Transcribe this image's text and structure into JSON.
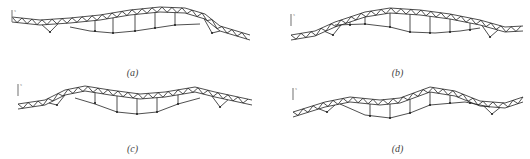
{
  "colors": {
    "line": "#222222",
    "axis": "#888888",
    "label": "#444444"
  },
  "panels": [
    {
      "id": "a",
      "caption": "(a)",
      "x": 0,
      "y": 0,
      "cap_y": 67,
      "axis": {
        "x": 12,
        "y": 18
      },
      "top": [
        [
          12,
          17
        ],
        [
          40,
          20
        ],
        [
          70,
          18
        ],
        [
          100,
          15
        ],
        [
          130,
          10
        ],
        [
          160,
          7
        ],
        [
          185,
          8
        ],
        [
          205,
          14
        ],
        [
          220,
          26
        ],
        [
          250,
          35
        ]
      ],
      "bottom": [
        [
          70,
          27
        ],
        [
          90,
          31
        ],
        [
          113,
          33
        ],
        [
          135,
          31
        ],
        [
          155,
          28
        ],
        [
          175,
          25
        ],
        [
          200,
          24
        ]
      ],
      "hangers": [
        [
          95,
          31
        ],
        [
          113,
          33
        ],
        [
          135,
          31
        ],
        [
          155,
          28
        ],
        [
          175,
          25
        ]
      ],
      "supports": [
        [
          50,
          32
        ],
        [
          212,
          33
        ]
      ]
    },
    {
      "id": "b",
      "caption": "(b)",
      "x": 265,
      "y": 0,
      "cap_y": 67,
      "axis": {
        "x": 26,
        "y": 22
      },
      "top": [
        [
          26,
          35
        ],
        [
          50,
          31
        ],
        [
          70,
          22
        ],
        [
          100,
          12
        ],
        [
          125,
          8
        ],
        [
          155,
          10
        ],
        [
          185,
          14
        ],
        [
          215,
          20
        ],
        [
          240,
          27
        ],
        [
          258,
          26
        ]
      ],
      "bottom": [
        [
          70,
          25
        ],
        [
          100,
          24
        ],
        [
          125,
          27
        ],
        [
          145,
          32
        ],
        [
          170,
          33
        ],
        [
          195,
          31
        ],
        [
          215,
          28
        ]
      ],
      "hangers": [
        [
          85,
          25
        ],
        [
          100,
          24
        ],
        [
          125,
          27
        ],
        [
          145,
          32
        ],
        [
          165,
          33
        ],
        [
          185,
          32
        ],
        [
          205,
          30
        ]
      ],
      "supports": [
        [
          68,
          35
        ],
        [
          225,
          37
        ]
      ]
    },
    {
      "id": "c",
      "caption": "(c)",
      "x": 0,
      "y": 80,
      "cap_y": 63,
      "axis": {
        "x": 18,
        "y": 12
      },
      "top": [
        [
          18,
          24
        ],
        [
          45,
          20
        ],
        [
          65,
          10
        ],
        [
          85,
          6
        ],
        [
          110,
          10
        ],
        [
          140,
          14
        ],
        [
          165,
          12
        ],
        [
          195,
          7
        ],
        [
          215,
          12
        ],
        [
          252,
          20
        ]
      ],
      "bottom": [
        [
          75,
          18
        ],
        [
          95,
          24
        ],
        [
          117,
          32
        ],
        [
          137,
          34
        ],
        [
          157,
          32
        ],
        [
          178,
          24
        ],
        [
          200,
          18
        ]
      ],
      "hangers": [
        [
          95,
          23
        ],
        [
          117,
          32
        ],
        [
          137,
          34
        ],
        [
          157,
          32
        ],
        [
          178,
          24
        ]
      ],
      "supports": [
        [
          57,
          25
        ],
        [
          220,
          27
        ]
      ]
    },
    {
      "id": "d",
      "caption": "(d)",
      "x": 265,
      "y": 80,
      "cap_y": 63,
      "axis": {
        "x": 28,
        "y": 16
      },
      "top": [
        [
          28,
          32
        ],
        [
          60,
          22
        ],
        [
          85,
          17
        ],
        [
          115,
          20
        ],
        [
          135,
          18
        ],
        [
          165,
          7
        ],
        [
          190,
          11
        ],
        [
          215,
          21
        ],
        [
          240,
          23
        ],
        [
          258,
          17
        ]
      ],
      "bottom": [
        [
          75,
          24
        ],
        [
          100,
          35
        ],
        [
          125,
          38
        ],
        [
          145,
          33
        ],
        [
          165,
          25
        ],
        [
          200,
          22
        ],
        [
          225,
          27
        ]
      ],
      "hangers": [
        [
          105,
          36
        ],
        [
          125,
          38
        ],
        [
          145,
          33
        ],
        [
          165,
          25
        ],
        [
          185,
          23
        ],
        [
          205,
          23
        ]
      ],
      "supports": [
        [
          62,
          32
        ],
        [
          227,
          34
        ]
      ]
    }
  ]
}
